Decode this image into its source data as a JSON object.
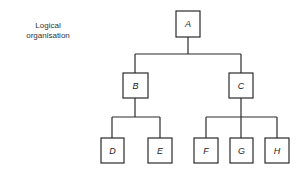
{
  "caption": {
    "line1": "Logical",
    "line2": "organisation"
  },
  "colors": {
    "stroke": "#2a2a2a",
    "background": "#ffffff",
    "text": "#222222"
  },
  "tree": {
    "nodes": [
      {
        "id": "A",
        "label": "A",
        "level": 0,
        "parent": null
      },
      {
        "id": "B",
        "label": "B",
        "level": 1,
        "parent": "A"
      },
      {
        "id": "C",
        "label": "C",
        "level": 1,
        "parent": "A"
      },
      {
        "id": "D",
        "label": "D",
        "level": 2,
        "parent": "B"
      },
      {
        "id": "E",
        "label": "E",
        "level": 2,
        "parent": "B"
      },
      {
        "id": "F",
        "label": "F",
        "level": 2,
        "parent": "C"
      },
      {
        "id": "G",
        "label": "G",
        "level": 2,
        "parent": "C"
      },
      {
        "id": "H",
        "label": "H",
        "level": 2,
        "parent": "C"
      }
    ]
  }
}
